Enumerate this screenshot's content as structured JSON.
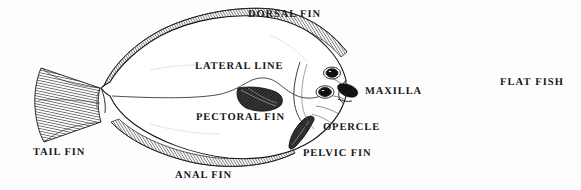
{
  "figure": {
    "title": "FLAT FISH",
    "background_color": "#fdfdfd",
    "ink_color": "#1a1a1a",
    "labels": {
      "dorsal_fin": "DORSAL FIN",
      "lateral_line": "LATERAL LINE",
      "pectoral_fin": "PECTORAL FIN",
      "maxilla": "MAXILLA",
      "opercle": "OPERCLE",
      "pelvic_fin": "PELVIC FIN",
      "anal_fin": "ANAL FIN",
      "tail_fin": "TAIL FIN"
    },
    "parts": [
      {
        "name": "dorsal-fin",
        "label": "DORSAL FIN",
        "shading": "hatched"
      },
      {
        "name": "lateral-line",
        "label": "LATERAL LINE",
        "shading": "thin-line"
      },
      {
        "name": "pectoral-fin",
        "label": "PECTORAL FIN",
        "shading": "dark-hatched"
      },
      {
        "name": "maxilla",
        "label": "MAXILLA",
        "shading": "dark"
      },
      {
        "name": "opercle",
        "label": "OPERCLE",
        "shading": "outline"
      },
      {
        "name": "pelvic-fin",
        "label": "PELVIC FIN",
        "shading": "dark-hatched"
      },
      {
        "name": "anal-fin",
        "label": "ANAL FIN",
        "shading": "hatched"
      },
      {
        "name": "tail-fin",
        "label": "TAIL FIN",
        "shading": "hatched"
      },
      {
        "name": "eye-upper",
        "label": "",
        "shading": "dark"
      },
      {
        "name": "eye-lower",
        "label": "",
        "shading": "dark"
      }
    ]
  }
}
